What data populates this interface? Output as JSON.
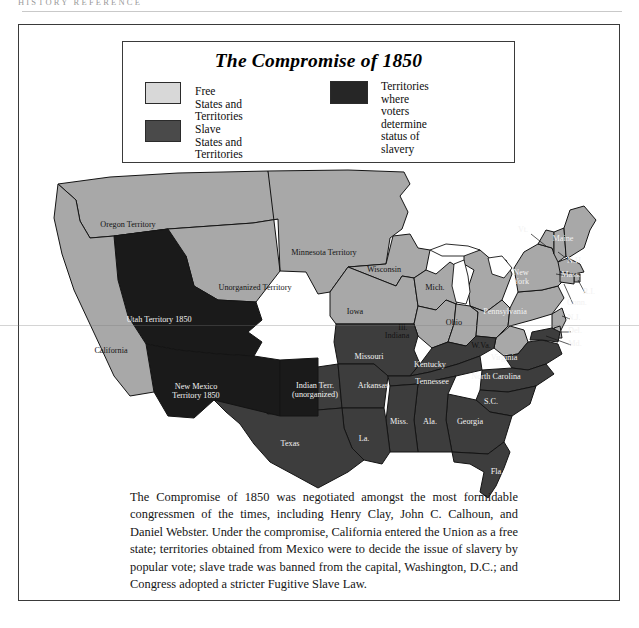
{
  "running_head": "HISTORY  REFERENCE",
  "legend": {
    "title": "The Compromise of 1850",
    "entries": [
      {
        "id": "free",
        "label": "Free States and Territories",
        "color": "#d8d8d8"
      },
      {
        "id": "territories",
        "label": "Territories where voters\ndetermine status of slavery",
        "color": "#262626"
      },
      {
        "id": "slave",
        "label": "Slave States and Territories",
        "color": "#4a4a4a"
      }
    ]
  },
  "colors": {
    "free": "#a8a8a8",
    "slave": "#3d3d3d",
    "popular_sovereignty": "#1a1a1a",
    "water": "#ffffff",
    "outline": "#141414",
    "frame": "#3a3a3a"
  },
  "map": {
    "regions": [
      {
        "name": "Oregon Territory",
        "label": "Oregon Territory",
        "status": "free",
        "x": 110,
        "y": 203
      },
      {
        "name": "Unorganized Territory",
        "label": "Unorganized Territory",
        "status": "free",
        "x": 237,
        "y": 266
      },
      {
        "name": "Utah Territory 1850",
        "label": "Utah Territory 1850",
        "status": "popular_sovereignty",
        "x": 141,
        "y": 298
      },
      {
        "name": "California",
        "label": "California",
        "status": "free",
        "x": 93,
        "y": 329
      },
      {
        "name": "New Mexico Territory 1850",
        "label": "New Mexico\nTerritory 1850",
        "status": "popular_sovereignty",
        "x": 178,
        "y": 365
      },
      {
        "name": "Minnesota Territory",
        "label": "Minnesota Territory",
        "status": "free",
        "x": 306,
        "y": 231
      },
      {
        "name": "Wisconsin",
        "label": "Wisconsin",
        "status": "free",
        "x": 366,
        "y": 248
      },
      {
        "name": "Michigan",
        "label": "Mich.",
        "status": "free",
        "x": 417,
        "y": 266
      },
      {
        "name": "Iowa",
        "label": "Iowa",
        "status": "free",
        "x": 337,
        "y": 290
      },
      {
        "name": "Illinois",
        "label": "Ill.",
        "status": "free",
        "x": 385,
        "y": 306
      },
      {
        "name": "Indiana",
        "label": "Indiana",
        "status": "free",
        "x": 379,
        "y": 314
      },
      {
        "name": "Ohio",
        "label": "Ohio",
        "status": "free",
        "x": 436,
        "y": 301
      },
      {
        "name": "Pennsylvania",
        "label": "Pennsylvania",
        "status": "free",
        "x": 487,
        "y": 290
      },
      {
        "name": "Missouri",
        "label": "Missouri",
        "status": "slave",
        "x": 351,
        "y": 335
      },
      {
        "name": "Kentucky",
        "label": "Kentucky",
        "status": "slave",
        "x": 412,
        "y": 343
      },
      {
        "name": "West Virginia",
        "label": "W.Va.",
        "status": "free",
        "x": 463,
        "y": 324
      },
      {
        "name": "Virginia",
        "label": "Virginia",
        "status": "slave",
        "x": 486,
        "y": 336
      },
      {
        "name": "Indian Territory",
        "label": "Indian Terr.\n(unorganized)",
        "status": "slave",
        "x": 297,
        "y": 364
      },
      {
        "name": "Arkansas",
        "label": "Arkansas",
        "status": "slave",
        "x": 355,
        "y": 364
      },
      {
        "name": "Tennessee",
        "label": "Tennessee",
        "status": "slave",
        "x": 414,
        "y": 360
      },
      {
        "name": "North Carolina",
        "label": "North Carolina",
        "status": "slave",
        "x": 478,
        "y": 355
      },
      {
        "name": "South Carolina",
        "label": "S.C.",
        "status": "slave",
        "x": 473,
        "y": 380
      },
      {
        "name": "Georgia",
        "label": "Georgia",
        "status": "slave",
        "x": 452,
        "y": 400
      },
      {
        "name": "Mississippi",
        "label": "Miss.",
        "status": "slave",
        "x": 381,
        "y": 400
      },
      {
        "name": "Alabama",
        "label": "Ala.",
        "status": "slave",
        "x": 412,
        "y": 400
      },
      {
        "name": "Louisiana",
        "label": "La.",
        "status": "slave",
        "x": 346,
        "y": 417
      },
      {
        "name": "Texas",
        "label": "Texas",
        "status": "slave",
        "x": 272,
        "y": 422
      },
      {
        "name": "Florida",
        "label": "Fla.",
        "status": "slave",
        "x": 479,
        "y": 450
      },
      {
        "name": "Vermont",
        "label": "Vt.",
        "status": "free",
        "x": 505,
        "y": 208
      },
      {
        "name": "Maine",
        "label": "Maine",
        "status": "free",
        "x": 545,
        "y": 217
      },
      {
        "name": "New Hampshire",
        "label": "N.H.",
        "status": "free",
        "x": 557,
        "y": 239
      },
      {
        "name": "New York",
        "label": "New\nYork",
        "status": "free",
        "x": 503,
        "y": 251
      },
      {
        "name": "Massachusetts",
        "label": "Mass.",
        "status": "free",
        "x": 553,
        "y": 253
      },
      {
        "name": "Rhode Island",
        "label": "R.I.",
        "status": "free",
        "x": 571,
        "y": 270
      },
      {
        "name": "Connecticut",
        "label": "Conn.",
        "status": "free",
        "x": 559,
        "y": 281
      },
      {
        "name": "New Jersey",
        "label": "N.J.",
        "status": "free",
        "x": 556,
        "y": 296
      },
      {
        "name": "Delaware",
        "label": "Del.",
        "status": "free",
        "x": 557,
        "y": 309
      },
      {
        "name": "Maryland",
        "label": "Md.",
        "status": "slave",
        "x": 557,
        "y": 322
      }
    ]
  },
  "caption": "The Compromise of 1850 was negotiated amongst the most formidable congressmen of the times, including Henry Clay, John C. Calhoun, and Daniel Webster.  Under the compromise, California entered the Union as a free state; territories obtained from Mexico were to decide the issue of slavery by popular vote; slave trade was banned from the capital, Washington, D.C.; and Congress adopted a stricter Fugitive Slave Law."
}
